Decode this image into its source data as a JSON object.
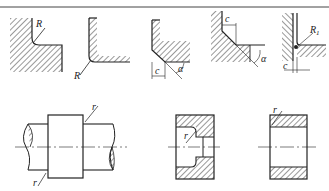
{
  "diagram": {
    "top_row": [
      {
        "id": "fillet-internal",
        "label": "R"
      },
      {
        "id": "fillet-external",
        "label": "R"
      },
      {
        "id": "chamfer-external",
        "labels": [
          "c",
          "α"
        ]
      },
      {
        "id": "chamfer-internal",
        "labels": [
          "c",
          "α"
        ]
      },
      {
        "id": "fillet-clearance",
        "labels": [
          "R1",
          "c"
        ]
      }
    ],
    "bottom_row": [
      {
        "id": "shaft-with-collar",
        "labels": [
          "r",
          "r"
        ]
      },
      {
        "id": "stepped-bore-section",
        "label": "r"
      },
      {
        "id": "straight-bore-section",
        "label": "r"
      }
    ],
    "labels": {
      "R": "R",
      "R1_main": "R",
      "R1_sub": "1",
      "c": "c",
      "alpha": "α",
      "r": "r"
    },
    "colors": {
      "line": "#222222",
      "hatch": "#333333",
      "background": "#ffffff"
    }
  }
}
